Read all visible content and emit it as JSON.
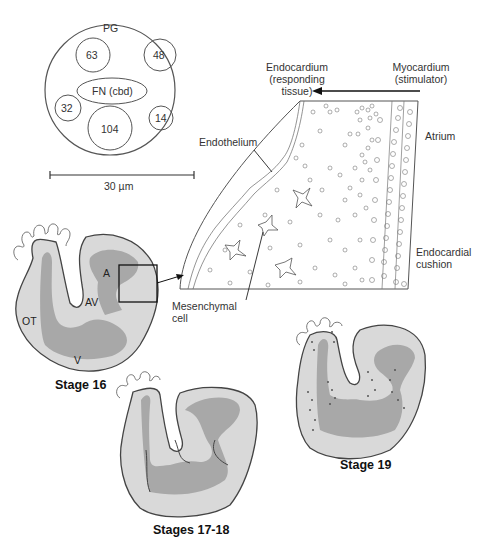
{
  "particle": {
    "outer_label": "PG",
    "center_label": "FN (cbd)",
    "numbers": [
      "63",
      "48",
      "32",
      "104",
      "14"
    ],
    "scale_bar": "30 µm"
  },
  "tissue": {
    "endocardium_line1": "Endocardium",
    "endocardium_line2": "(responding",
    "endocardium_line3": "tissue)",
    "myocardium_line1": "Myocardium",
    "myocardium_line2": "(stimulator)",
    "endothelium": "Endothelium",
    "atrium": "Atrium",
    "cushion_line1": "Endocardial",
    "cushion_line2": "cushion",
    "mesenchymal_line1": "Mesenchymal",
    "mesenchymal_line2": "cell"
  },
  "hearts": {
    "stage16": {
      "title": "Stage 16",
      "A": "A",
      "AV": "AV",
      "OT": "OT",
      "V": "V"
    },
    "stage17": {
      "title": "Stages 17-18"
    },
    "stage19": {
      "title": "Stage 19"
    }
  },
  "colors": {
    "outer_gray": "#d9d9d9",
    "inner_gray": "#a8a8a8",
    "outline": "#444444"
  }
}
